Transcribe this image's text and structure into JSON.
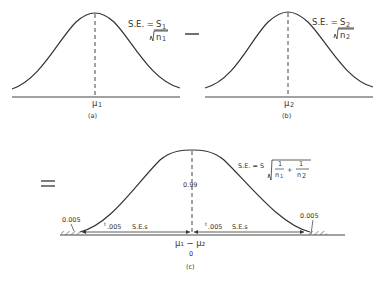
{
  "panel_a": {
    "se_label": "S.E. =",
    "se_numerator": "S",
    "se_numerator_sub": "1",
    "se_denominator": "n",
    "se_denominator_sub": "1",
    "mean_label": "μ",
    "mean_sub": "1",
    "caption": "(a)"
  },
  "operator_minus": "—",
  "panel_b": {
    "se_label": "S.E. =",
    "se_numerator": "S",
    "se_numerator_sub": "2",
    "se_denominator": "n",
    "se_denominator_sub": "2",
    "mean_label": "μ",
    "mean_sub": "2",
    "caption": "(b)"
  },
  "operator_equals": "=",
  "panel_c": {
    "se_label": "S.E. = S",
    "se_term1_num": "1",
    "se_term1_den": "n",
    "se_term1_den_sub": "1",
    "se_plus": "+",
    "se_term2_num": "1",
    "se_term2_den": "n",
    "se_term2_den_sub": "2",
    "center_prob": "0.99",
    "left_tail": "0.005",
    "right_tail": "0.005",
    "left_arrow_label_t": "t",
    "left_arrow_label_sub": ".005",
    "left_arrow_label_rest": "S.E.s",
    "right_arrow_label_t": "t",
    "right_arrow_label_sub": ".005",
    "right_arrow_label_rest": "S.E.s",
    "mean_label": "μ₁ − μ₂",
    "mean_value": "0",
    "caption": "(c)"
  }
}
